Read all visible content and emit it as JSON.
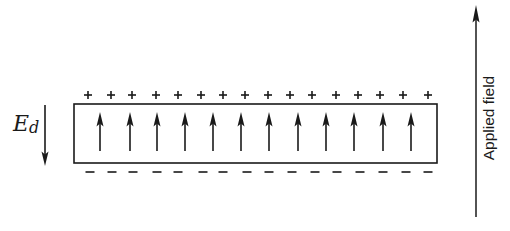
{
  "diagram": {
    "type": "polarized-slab-depolarization-field",
    "slab": {
      "box": {
        "x": 74,
        "y": 104,
        "width": 363,
        "height": 59
      },
      "stroke_color": "#1a1a1a",
      "polarization_arrows": {
        "count": 12,
        "direction": "up",
        "x": [
          100,
          130,
          157,
          185,
          213,
          241,
          269,
          298,
          326,
          354,
          383,
          411
        ],
        "y_top": 112,
        "y_bottom": 151
      }
    },
    "surface_charges": {
      "top": {
        "symbol": "+",
        "count": 16,
        "y": 95,
        "x": [
          88,
          111,
          132,
          156,
          178,
          201,
          223,
          245,
          268,
          290,
          312,
          336,
          358,
          380,
          403,
          428
        ]
      },
      "bottom": {
        "symbol": "−",
        "count": 16,
        "y": 172,
        "x": [
          90,
          112,
          133,
          157,
          178,
          203,
          223,
          247,
          269,
          292,
          315,
          337,
          360,
          383,
          406,
          428
        ]
      }
    },
    "depolarization_field": {
      "label_main": "E",
      "label_sub": "d",
      "arrow": {
        "x": 45,
        "y_start": 105,
        "y_end": 166,
        "direction": "down"
      }
    },
    "applied_field": {
      "label": "Applied field",
      "arrow": {
        "x": 476,
        "y_start": 217,
        "y_end": 5,
        "direction": "up"
      }
    }
  }
}
